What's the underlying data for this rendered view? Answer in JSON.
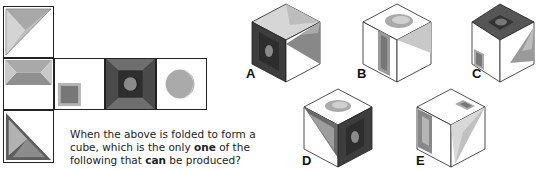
{
  "net": {
    "faces": [
      {
        "id": "top-left",
        "pattern": "light-triangle-diagonal",
        "row": 0,
        "col": 0
      },
      {
        "id": "middle-left",
        "pattern": "hourglass-bevel",
        "row": 1,
        "col": 0
      },
      {
        "id": "middle-blank-square",
        "pattern": "small-square-corner",
        "row": 1,
        "col": 1
      },
      {
        "id": "middle-dark-moon",
        "pattern": "dark-bevel-moon",
        "row": 1,
        "col": 2
      },
      {
        "id": "middle-light-moon",
        "pattern": "light-circle-moon",
        "row": 1,
        "col": 3
      },
      {
        "id": "bottom-left",
        "pattern": "dark-triangle-diagonal",
        "row": 2,
        "col": 0
      }
    ]
  },
  "question": {
    "line1": "When the above is folded to form a",
    "line2_pre": "cube, which is the only ",
    "line2_bold": "one",
    "line2_post": " of the",
    "line3_pre": "following that ",
    "line3_bold": "can",
    "line3_post": " be produced?"
  },
  "options": [
    {
      "label": "A"
    },
    {
      "label": "B"
    },
    {
      "label": "C"
    },
    {
      "label": "D"
    },
    {
      "label": "E"
    }
  ]
}
